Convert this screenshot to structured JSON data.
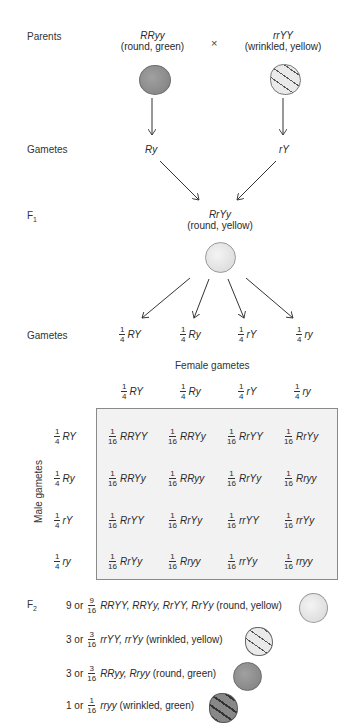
{
  "labels": {
    "parents": "Parents",
    "gametes1": "Gametes",
    "f1": "F",
    "f1_sub": "1",
    "gametes2": "Gametes",
    "female_gametes": "Female gametes",
    "male_gametes": "Male gametes",
    "f2": "F",
    "f2_sub": "2"
  },
  "parents": {
    "left": {
      "genotype": "RRyy",
      "phenotype": "(round, green)"
    },
    "cross": "×",
    "right": {
      "genotype": "rrYY",
      "phenotype": "(wrinkled, yellow)"
    }
  },
  "gametes_parent": {
    "left": "Ry",
    "right": "rY"
  },
  "f1": {
    "genotype": "RrYy",
    "phenotype": "(round, yellow)"
  },
  "f1_gametes": [
    {
      "num": "1",
      "den": "4",
      "allele": "RY"
    },
    {
      "num": "1",
      "den": "4",
      "allele": "Ry"
    },
    {
      "num": "1",
      "den": "4",
      "allele": "rY"
    },
    {
      "num": "1",
      "den": "4",
      "allele": "ry"
    }
  ],
  "punnett": {
    "female": [
      {
        "num": "1",
        "den": "4",
        "allele": "RY"
      },
      {
        "num": "1",
        "den": "4",
        "allele": "Ry"
      },
      {
        "num": "1",
        "den": "4",
        "allele": "rY"
      },
      {
        "num": "1",
        "den": "4",
        "allele": "ry"
      }
    ],
    "male": [
      {
        "num": "1",
        "den": "4",
        "allele": "RY"
      },
      {
        "num": "1",
        "den": "4",
        "allele": "Ry"
      },
      {
        "num": "1",
        "den": "4",
        "allele": "rY"
      },
      {
        "num": "1",
        "den": "4",
        "allele": "ry"
      }
    ],
    "rows": [
      [
        {
          "num": "1",
          "den": "16",
          "g": "RRYY"
        },
        {
          "num": "1",
          "den": "16",
          "g": "RRYy"
        },
        {
          "num": "1",
          "den": "16",
          "g": "RrYY"
        },
        {
          "num": "1",
          "den": "16",
          "g": "RrYy"
        }
      ],
      [
        {
          "num": "1",
          "den": "16",
          "g": "RRYy"
        },
        {
          "num": "1",
          "den": "16",
          "g": "RRyy"
        },
        {
          "num": "1",
          "den": "16",
          "g": "RrYy"
        },
        {
          "num": "1",
          "den": "16",
          "g": "Rryy"
        }
      ],
      [
        {
          "num": "1",
          "den": "16",
          "g": "RrYY"
        },
        {
          "num": "1",
          "den": "16",
          "g": "RrYy"
        },
        {
          "num": "1",
          "den": "16",
          "g": "rrYY"
        },
        {
          "num": "1",
          "den": "16",
          "g": "rrYy"
        }
      ],
      [
        {
          "num": "1",
          "den": "16",
          "g": "RrYy"
        },
        {
          "num": "1",
          "den": "16",
          "g": "Rryy"
        },
        {
          "num": "1",
          "den": "16",
          "g": "rrYy"
        },
        {
          "num": "1",
          "den": "16",
          "g": "rryy"
        }
      ]
    ]
  },
  "f2": [
    {
      "count": "9 or",
      "num": "9",
      "den": "16",
      "genotypes": "RRYY, RRYy, RrYY, RrYy",
      "phenotype": "(round, yellow)"
    },
    {
      "count": "3 or",
      "num": "3",
      "den": "16",
      "genotypes": "rrYY, rrYy",
      "phenotype": "(wrinkled, yellow)"
    },
    {
      "count": "3 or",
      "num": "3",
      "den": "16",
      "genotypes": "RRyy, Rryy",
      "phenotype": "(round, green)"
    },
    {
      "count": "1 or",
      "num": "1",
      "den": "16",
      "genotypes": "rryy",
      "phenotype": "(wrinkled, green)"
    }
  ],
  "colors": {
    "green_pea": "#8c8c8c",
    "yellow_pea": "#e4e4e4",
    "punnett_bg": "#f2f2f2",
    "arrow": "#333333"
  }
}
